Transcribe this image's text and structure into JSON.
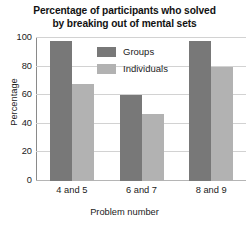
{
  "chart_data": {
    "type": "bar",
    "title": "Percentage of participants who solved by breaking out of mental sets",
    "title_lines": [
      "Percentage of participants who solved",
      "by breaking out of mental sets"
    ],
    "xlabel": "Problem number",
    "ylabel": "Percentage",
    "categories": [
      "4 and 5",
      "6 and 7",
      "8 and 9"
    ],
    "series": [
      {
        "name": "Groups",
        "values": [
          98,
          60,
          98
        ],
        "color": "#787878"
      },
      {
        "name": "Individuals",
        "values": [
          68,
          47,
          80
        ],
        "color": "#b2b2b2"
      }
    ],
    "ylim": [
      0,
      100
    ],
    "yticks": [
      0,
      20,
      40,
      60,
      80,
      100
    ],
    "ytick_labels": [
      "0",
      "20",
      "40",
      "60",
      "80",
      "100"
    ],
    "grid": true,
    "grid_axis": "y",
    "legend_position": "upper center"
  },
  "legend": {
    "entries": [
      {
        "label": "Groups",
        "color": "#787878"
      },
      {
        "label": "Individuals",
        "color": "#b2b2b2"
      }
    ]
  },
  "colors": {
    "groups": "#787878",
    "individuals": "#b2b2b2",
    "gridline": "#d2d2d2",
    "axis": "#8a8a8a",
    "text": "#1b1b1b",
    "background": "#ffffff"
  }
}
